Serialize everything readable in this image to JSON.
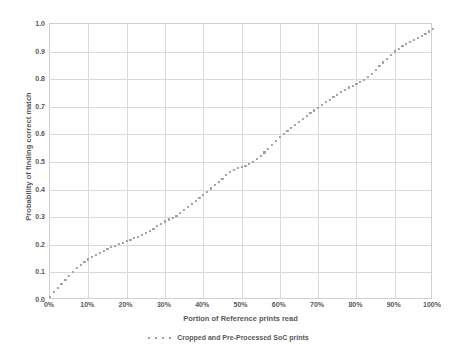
{
  "chart_data": {
    "type": "scatter",
    "title": "",
    "xlabel": "Portion of Reference prints read",
    "ylabel": "Probability of finding correct match",
    "xlim": [
      0,
      100
    ],
    "ylim": [
      0,
      1.0
    ],
    "grid": true,
    "legend_position": "bottom",
    "x_tick_labels": [
      "0%",
      "10%",
      "20%",
      "30%",
      "40%",
      "50%",
      "60%",
      "70%",
      "80%",
      "90%",
      "100%"
    ],
    "x_tick_values": [
      0,
      10,
      20,
      30,
      40,
      50,
      60,
      70,
      80,
      90,
      100
    ],
    "y_tick_labels": [
      "0.0",
      "0.1",
      "0.2",
      "0.3",
      "0.4",
      "0.5",
      "0.6",
      "0.7",
      "0.8",
      "0.9",
      "1.0"
    ],
    "y_tick_values": [
      0.0,
      0.1,
      0.2,
      0.3,
      0.4,
      0.5,
      0.6,
      0.7,
      0.8,
      0.9,
      1.0
    ],
    "series": [
      {
        "name": "Cropped and Pre-Processed SoC prints",
        "color": "#a0a0a0",
        "marker": "square-dotted",
        "x": [
          0,
          1,
          2,
          3,
          4,
          5,
          6,
          7,
          8,
          9,
          10,
          11,
          12,
          13,
          14,
          15,
          16,
          17,
          18,
          19,
          20,
          21,
          22,
          23,
          24,
          25,
          26,
          27,
          28,
          29,
          30,
          31,
          32,
          33,
          34,
          35,
          36,
          37,
          38,
          39,
          40,
          41,
          42,
          43,
          44,
          45,
          46,
          47,
          48,
          49,
          50,
          51,
          52,
          53,
          54,
          55,
          56,
          57,
          58,
          59,
          60,
          61,
          62,
          63,
          64,
          65,
          66,
          67,
          68,
          69,
          70,
          71,
          72,
          73,
          74,
          75,
          76,
          77,
          78,
          79,
          80,
          81,
          82,
          83,
          84,
          85,
          86,
          87,
          88,
          89,
          90,
          91,
          92,
          93,
          94,
          95,
          96,
          97,
          98,
          99,
          100
        ],
        "y": [
          0.012,
          0.028,
          0.043,
          0.057,
          0.072,
          0.087,
          0.101,
          0.116,
          0.128,
          0.138,
          0.147,
          0.155,
          0.163,
          0.17,
          0.177,
          0.184,
          0.191,
          0.197,
          0.203,
          0.208,
          0.213,
          0.218,
          0.224,
          0.23,
          0.237,
          0.244,
          0.251,
          0.259,
          0.267,
          0.276,
          0.285,
          0.292,
          0.298,
          0.305,
          0.315,
          0.325,
          0.336,
          0.347,
          0.358,
          0.369,
          0.38,
          0.392,
          0.404,
          0.416,
          0.428,
          0.44,
          0.452,
          0.463,
          0.472,
          0.478,
          0.482,
          0.486,
          0.492,
          0.5,
          0.51,
          0.522,
          0.535,
          0.548,
          0.562,
          0.576,
          0.59,
          0.602,
          0.613,
          0.624,
          0.635,
          0.646,
          0.657,
          0.667,
          0.677,
          0.687,
          0.697,
          0.707,
          0.717,
          0.726,
          0.735,
          0.744,
          0.753,
          0.762,
          0.77,
          0.777,
          0.783,
          0.79,
          0.798,
          0.808,
          0.82,
          0.833,
          0.847,
          0.861,
          0.875,
          0.889,
          0.901,
          0.911,
          0.92,
          0.928,
          0.936,
          0.943,
          0.95,
          0.957,
          0.965,
          0.973,
          0.982
        ]
      }
    ]
  }
}
